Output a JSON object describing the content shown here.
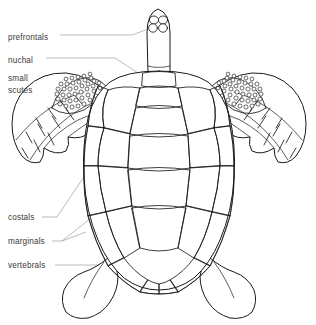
{
  "diagram": {
    "view": "dorsal",
    "background_color": "#ffffff",
    "line_color": "#1a1a1a",
    "leader_color": "#8e8e8e",
    "text_color": "#3a3a3a"
  },
  "labels": [
    {
      "id": "prefrontals",
      "text": "prefrontals",
      "lines": [
        "prefrontals"
      ],
      "x": 8,
      "y": 37,
      "target": "head-prefrontal-scales"
    },
    {
      "id": "nuchal",
      "text": "nuchal",
      "lines": [
        "nuchal"
      ],
      "x": 8,
      "y": 60,
      "target": "nuchal-scute"
    },
    {
      "id": "small-scutes",
      "text": "small scutes",
      "lines": [
        "small",
        "scutes"
      ],
      "x": 8,
      "y": 80,
      "target": "front-flipper-small-scutes"
    },
    {
      "id": "costals",
      "text": "costals",
      "lines": [
        "costals"
      ],
      "x": 8,
      "y": 219,
      "target": "costal-scutes"
    },
    {
      "id": "marginals",
      "text": "marginals",
      "lines": [
        "marginals"
      ],
      "x": 8,
      "y": 243,
      "target": "marginal-scutes"
    },
    {
      "id": "vertebrals",
      "text": "vertebrals",
      "lines": [
        "vertebrals"
      ],
      "x": 8,
      "y": 267,
      "target": "vertebral-scutes"
    }
  ],
  "anatomy": {
    "head": {
      "name": "head",
      "prefrontal_scale_count": 4
    },
    "carapace": {
      "name": "carapace",
      "vertebral_scute_count": 5,
      "costal_scute_pairs": 4,
      "nuchal_scute_count": 1
    },
    "flippers": {
      "front_count": 2,
      "rear_count": 2
    }
  }
}
